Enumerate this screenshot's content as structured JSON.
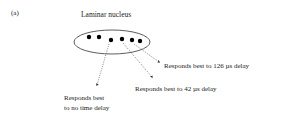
{
  "panel_label": "(a)",
  "title": "Laminar nucleus",
  "ellipse": {
    "cx": 112,
    "cy": 42,
    "rx": 38,
    "ry": 12,
    "stroke": "#333333"
  },
  "neurons": [
    {
      "x": 89,
      "y": 37
    },
    {
      "x": 99,
      "y": 37
    },
    {
      "x": 111,
      "y": 40
    },
    {
      "x": 122,
      "y": 39
    },
    {
      "x": 132,
      "y": 40
    },
    {
      "x": 140,
      "y": 41
    }
  ],
  "annotations": [
    {
      "id": "no-delay",
      "line1": "Responds best",
      "line2": "to no time delay",
      "from_neuron": 2
    },
    {
      "id": "delay-42",
      "text": "Responds best to 42 µs delay",
      "from_neuron": 3
    },
    {
      "id": "delay-126",
      "text": "Responds best to 126 µs delay",
      "from_neuron": 4
    }
  ],
  "colors": {
    "ink": "#1a1a1a",
    "arrow": "#555555",
    "background": "#ffffff"
  }
}
